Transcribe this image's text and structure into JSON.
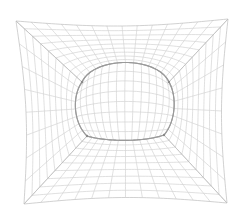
{
  "figure": {
    "type": "structured-mesh",
    "colors": {
      "background": "#ffffff",
      "grid_line": "#d2d2d2",
      "block_edge": "#bdbdbd",
      "tunnel_outline": "#9a9a9a",
      "corner_node": "#8a8a8a"
    },
    "outer_boundary": {
      "top_left": [
        16,
        21
      ],
      "top_right": [
        228,
        19
      ],
      "bottom_right": [
        227,
        203
      ],
      "bottom_left": [
        24,
        204
      ],
      "bulge": 6
    },
    "tunnel": {
      "center": [
        124,
        108
      ],
      "arch_top_y": 60,
      "left_x": 74,
      "right_x": 175,
      "corner_top_left": [
        82,
        82
      ],
      "corner_top_right": [
        169,
        82
      ],
      "corner_bottom_left": [
        87,
        136
      ],
      "corner_bottom_right": [
        164,
        135
      ],
      "invert_bottom_y": 140
    },
    "divisions": {
      "radial": 9,
      "top_arc": 14,
      "side_arc": 8,
      "bottom_arc": 12,
      "interior": 12
    }
  }
}
